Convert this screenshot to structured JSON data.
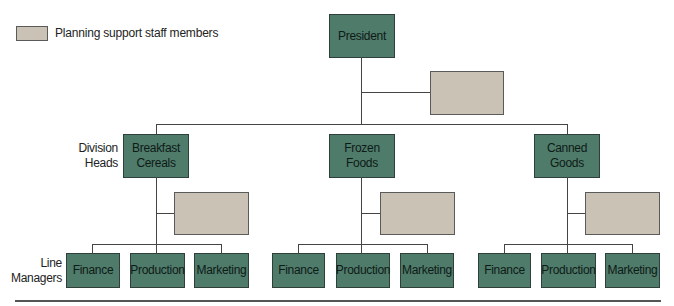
{
  "legend": {
    "label": "Planning support staff members",
    "color": "#cbc2b6"
  },
  "row_labels": {
    "division_heads": "Division\nHeads",
    "division_heads_l1": "Division",
    "division_heads_l2": "Heads",
    "line_managers_l1": "Line",
    "line_managers_l2": "Managers"
  },
  "colors": {
    "unit_fill": "#4f7b6b",
    "unit_border": "#2e4039",
    "staff_fill": "#cbc2b6",
    "connector": "#444444"
  },
  "org": {
    "president": "President",
    "divisions": [
      {
        "l1": "Breakfast",
        "l2": "Cereals",
        "managers": [
          "Finance",
          "Production",
          "Marketing"
        ]
      },
      {
        "l1": "Frozen",
        "l2": "Foods",
        "managers": [
          "Finance",
          "Production",
          "Marketing"
        ]
      },
      {
        "l1": "Canned",
        "l2": "Goods",
        "managers": [
          "Finance",
          "Production",
          "Marketing"
        ]
      }
    ]
  }
}
